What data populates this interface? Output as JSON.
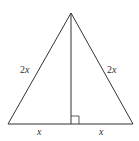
{
  "diagram": {
    "type": "isosceles-triangle-with-altitude",
    "colors": {
      "stroke": "#333333",
      "background": "#ffffff"
    },
    "labels": {
      "left_side": {
        "coef": "2",
        "var": "x"
      },
      "right_side": {
        "coef": "2",
        "var": "x"
      },
      "base_left": "x",
      "base_right": "x"
    },
    "right_angle_marker": true
  }
}
